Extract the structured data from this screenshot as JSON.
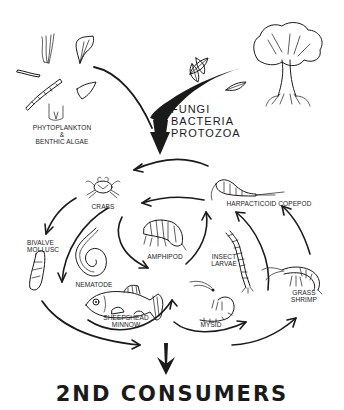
{
  "diagram": {
    "type": "food-web",
    "colors": {
      "ink": "#1a1a1a",
      "background": "#ffffff"
    },
    "sources": {
      "producers_label_line1": "PHYTOPLANKTON",
      "producers_label_line2": "&",
      "producers_label_line3": "BENTHIC ALGAE",
      "decomposers_prefix": "+",
      "decomposers": [
        "FUNGI",
        "BACTERIA",
        "PROTOZOA"
      ]
    },
    "consumers": {
      "crabs": "CRABS",
      "harpacticoid": "HARPACTICOID COPEPOD",
      "bivalve_line1": "BIVALVE",
      "bivalve_line2": "MOLLUSC",
      "amphipod": "AMPHIPOD",
      "insect_line1": "INSECT",
      "insect_line2": "LARVAE",
      "nematode": "NEMATODE",
      "grass_shrimp_line1": "GRASS",
      "grass_shrimp_line2": "SHRIMP",
      "sheepshead_line1": "SHEEPSHEAD",
      "sheepshead_line2": "MINNOW",
      "mysid": "MYSID"
    },
    "output": {
      "title": "2ND CONSUMERS"
    }
  }
}
